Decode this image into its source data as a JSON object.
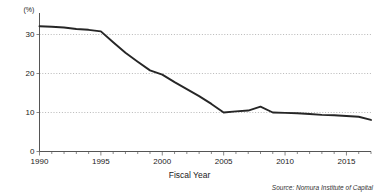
{
  "chart_data": {
    "type": "line",
    "title": "",
    "xlabel": "Fiscal Year",
    "ylabel": "",
    "yunit": "(%)",
    "xlim": [
      1990,
      2017
    ],
    "ylim": [
      0,
      35
    ],
    "grid": true,
    "grid_axis": "y",
    "legend": "none",
    "x_tick_labels": [
      "1990",
      "1995",
      "2000",
      "2005",
      "2010",
      "2015"
    ],
    "x_tick_values": [
      1990,
      1995,
      2000,
      2005,
      2010,
      2015
    ],
    "x_minor_tick_step": 1,
    "y_tick_labels": [
      "0",
      "10",
      "20",
      "30"
    ],
    "y_tick_values": [
      0,
      10,
      20,
      30
    ],
    "line_color": "#262626",
    "series": [
      {
        "name": "ratio",
        "x": [
          1990,
          1991,
          1992,
          1993,
          1994,
          1995,
          1996,
          1997,
          1998,
          1999,
          2000,
          2001,
          2002,
          2003,
          2004,
          2005,
          2006,
          2007,
          2008,
          2009,
          2010,
          2011,
          2012,
          2013,
          2014,
          2015,
          2016,
          2017
        ],
        "values": [
          32.1,
          32.0,
          31.8,
          31.4,
          31.2,
          30.8,
          28.0,
          25.3,
          23.0,
          20.8,
          19.7,
          17.8,
          16.0,
          14.2,
          12.2,
          10.0,
          10.3,
          10.5,
          11.5,
          10.0,
          9.9,
          9.8,
          9.6,
          9.4,
          9.3,
          9.1,
          8.9,
          8.1
        ]
      }
    ],
    "source": "Source: Nomura Institute of Capital"
  },
  "labels": {
    "y_unit": "(%)",
    "x_axis_title": "Fiscal Year",
    "source": "Source: Nomura Institute of Capital"
  }
}
